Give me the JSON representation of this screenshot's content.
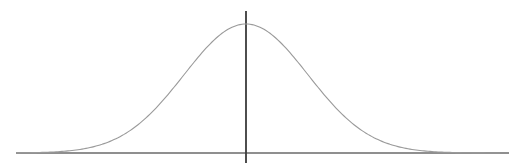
{
  "diagram": {
    "title": "",
    "type": "normal-distribution-curve",
    "colors": {
      "background": "#ffffff",
      "curve": "#9a9a9a",
      "x_axis": "#6a6a6a",
      "y_axis": "#3a3a3a"
    },
    "x_axis": {
      "x1": 16,
      "x2": 509,
      "y": 153
    },
    "y_axis": {
      "x": 246,
      "y1": 11,
      "y2": 163
    },
    "curve": {
      "center_x": 246,
      "peak_y": 24,
      "baseline_y": 153,
      "sigma_px": 62,
      "x_start": 16,
      "x_end": 500
    }
  },
  "chart_data": {
    "type": "line",
    "title": "",
    "xlabel": "",
    "ylabel": "",
    "series": [
      {
        "name": "normal-density",
        "mean": 0,
        "std": 1,
        "x": [
          -3.7,
          -3,
          -2.5,
          -2,
          -1.5,
          -1,
          -0.5,
          0,
          0.5,
          1,
          1.5,
          2,
          2.5,
          3,
          4.1
        ],
        "values": [
          0.0004,
          0.0044,
          0.0175,
          0.054,
          0.1295,
          0.242,
          0.3521,
          0.3989,
          0.3521,
          0.242,
          0.1295,
          0.054,
          0.0175,
          0.0044,
          0.0001
        ]
      }
    ],
    "grid": false,
    "legend": "none"
  }
}
